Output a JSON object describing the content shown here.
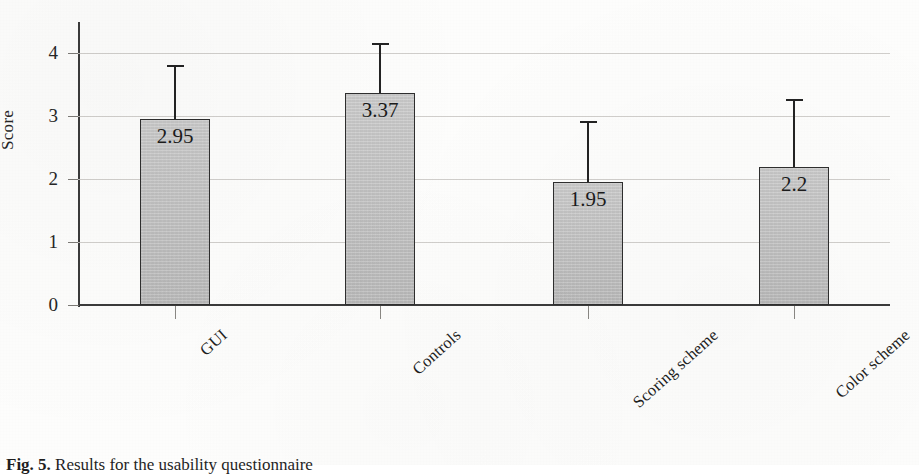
{
  "figure": {
    "caption_label": "Fig. 5.",
    "caption_text": "Results for the usability questionnaire"
  },
  "chart_data": {
    "type": "bar",
    "title": "",
    "xlabel": "",
    "ylabel": "Score",
    "ylim": [
      0,
      4.5
    ],
    "yticks": [
      "0",
      "1",
      "2",
      "3",
      "4"
    ],
    "ytick_values": [
      0,
      1,
      2,
      3,
      4
    ],
    "grid": "horizontal",
    "legend": "none",
    "categories": [
      "GUI",
      "Controls",
      "Scoring scheme",
      "Color scheme"
    ],
    "values": [
      2.95,
      3.37,
      1.95,
      2.2
    ],
    "value_labels": [
      "2.95",
      "3.37",
      "1.95",
      "2.2"
    ],
    "error_upper": [
      3.82,
      4.17,
      2.93,
      3.27
    ],
    "error_bar_type": "upper-only",
    "bar_fill_color": "#c3c3c3",
    "bar_edge_color": "#2e2e2e",
    "axis_color": "#3b3b3b",
    "gridline_color": "#c9c7c3"
  }
}
